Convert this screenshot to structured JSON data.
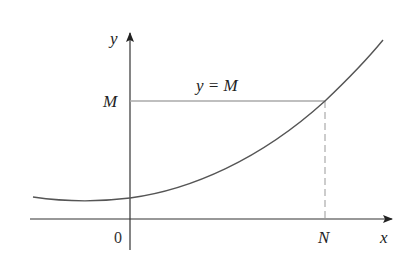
{
  "diagram": {
    "axes": {
      "x_label": "x",
      "y_label": "y",
      "origin_label": "0"
    },
    "horizontal_line": {
      "label": "y = M",
      "y_tick_label": "M"
    },
    "vertical_line": {
      "x_tick_label": "N",
      "style": "dashed"
    },
    "curve": {
      "description": "increasing convex function crossing y = M at x = N"
    },
    "colors": {
      "axes": "#333333",
      "curve": "#555555",
      "guide_line": "#aaaaaa"
    }
  }
}
